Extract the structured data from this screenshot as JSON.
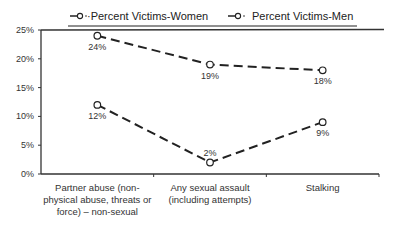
{
  "chart_data": {
    "type": "line",
    "title": "",
    "xlabel": "",
    "ylabel": "",
    "ylim": [
      0,
      25
    ],
    "yticks": [
      0,
      5,
      10,
      15,
      20,
      25
    ],
    "ytick_labels": [
      "0%",
      "5%",
      "10%",
      "15%",
      "20%",
      "25%"
    ],
    "grid": false,
    "legend_position": "top",
    "categories": [
      [
        "Partner abuse (non-",
        "physical abuse, threats or",
        "force) – non-sexual"
      ],
      [
        "Any sexual assault",
        "(including attempts)"
      ],
      [
        "Stalking"
      ]
    ],
    "series": [
      {
        "name": "·Percent Victims-Women",
        "values": [
          24,
          19,
          18
        ],
        "labels": [
          "24%",
          "19%",
          "18%"
        ],
        "marker": "diamond-open",
        "line_style": "dashed",
        "color": "#222222"
      },
      {
        "name": "Percent Victims-Men",
        "values": [
          12,
          2,
          9
        ],
        "labels": [
          "12%",
          "2%",
          "9%"
        ],
        "marker": "circle-open",
        "line_style": "dashed",
        "color": "#222222"
      }
    ]
  }
}
